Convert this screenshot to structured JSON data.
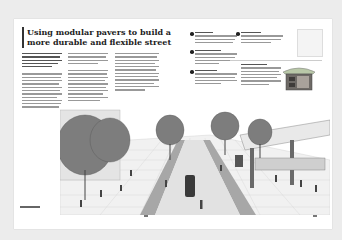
{
  "spread": {
    "title": "Using modular pavers to build a more durable and flexible street",
    "intro_text": "[illegible body text — intro paragraph]",
    "body_columns": [
      "[illegible body text — column 1]",
      "[illegible body text — column 2]",
      "[illegible body text — column 3]"
    ],
    "callouts": [
      {
        "label": "[illegible callout 1]"
      },
      {
        "label": "[illegible callout 2]"
      },
      {
        "label": "[illegible callout 3]"
      },
      {
        "label": "[illegible callout 4]"
      }
    ],
    "sidebar_note": "[illegible sidebar text]",
    "caption": "[illegible caption]",
    "colors": {
      "ink": "#222222",
      "paper": "#ffffff",
      "background": "#ececec"
    }
  }
}
